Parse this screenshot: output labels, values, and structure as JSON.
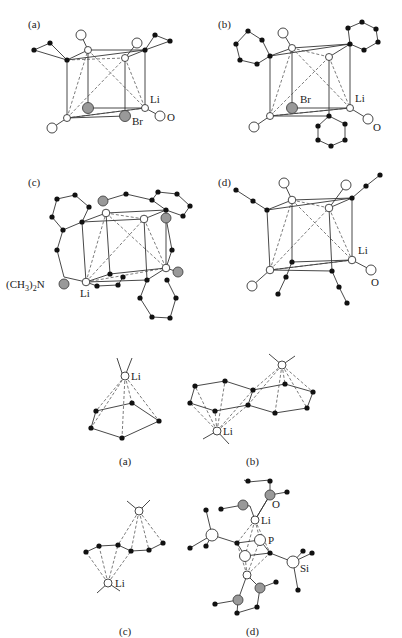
{
  "figure": {
    "upper_panels": {
      "a": {
        "tag": "(a)",
        "labels": {
          "li": "Li",
          "br": "Br",
          "o": "O"
        }
      },
      "b": {
        "tag": "(b)",
        "labels": {
          "li": "Li",
          "br": "Br",
          "o": "O"
        }
      },
      "c": {
        "tag": "(c)",
        "labels": {
          "li": "Li",
          "nme2_pre": "(CH",
          "nme2_sub1": "3",
          "nme2_mid": ")",
          "nme2_sub2": "2",
          "nme2_post": "N"
        }
      },
      "d": {
        "tag": "(d)",
        "labels": {
          "li": "Li",
          "o": "O"
        }
      }
    },
    "lower_panels": {
      "a": {
        "tag": "(a)",
        "labels": {
          "li": "Li"
        }
      },
      "b": {
        "tag": "(b)",
        "labels": {
          "li": "Li"
        }
      },
      "c": {
        "tag": "(c)",
        "labels": {
          "li": "Li"
        }
      },
      "d": {
        "tag": "(d)",
        "labels": {
          "li": "Li",
          "o": "O",
          "p": "P",
          "si": "Si"
        }
      }
    },
    "legend_colors": {
      "carbon": "#111111",
      "lithium": "#ffffff",
      "heteroatom": "#999999"
    }
  }
}
